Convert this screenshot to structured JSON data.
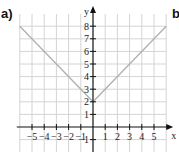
{
  "panels": {
    "a_label": "a)",
    "b_label": "b"
  },
  "chart_data": {
    "type": "line",
    "title": "",
    "equation_hint": "y = |x| + 2",
    "xlabel": "x",
    "ylabel": "y",
    "xlim": [
      -6,
      6
    ],
    "ylim": [
      -1,
      8
    ],
    "grid": true,
    "x_ticks": [
      -5,
      -4,
      -3,
      -2,
      -1,
      1,
      2,
      3,
      4,
      5
    ],
    "y_ticks": [
      -1,
      1,
      2,
      3,
      4,
      5,
      6,
      7,
      8
    ],
    "x_tick_labels": [
      "−5",
      "−4",
      "−3",
      "−2",
      "−1",
      "1",
      "2",
      "3",
      "4",
      "5"
    ],
    "y_tick_labels": [
      "−1",
      "1",
      "2",
      "3",
      "4",
      "5",
      "6",
      "7",
      "8"
    ],
    "series": [
      {
        "name": "graph",
        "color": "#b0b0b0",
        "x": [
          -6,
          0,
          6
        ],
        "y": [
          8,
          2,
          8
        ]
      }
    ],
    "colors": {
      "grid": "#d4d4d4",
      "axis": "#111111",
      "line": "#b0b0b0"
    }
  }
}
